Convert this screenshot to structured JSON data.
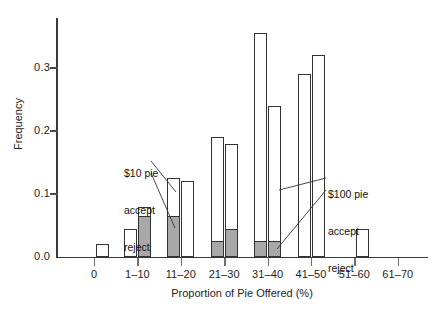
{
  "chart_data": {
    "type": "bar",
    "title": "",
    "subtitle": "",
    "xlabel": "Proportion of Pie Offered (%)",
    "ylabel": "Frequency",
    "categories": [
      "0",
      "1–10",
      "11–20",
      "21–30",
      "31–40",
      "41–50",
      "51–60",
      "61–70"
    ],
    "ylim": [
      0.0,
      0.39
    ],
    "xlim_note": "categorical, 8 bins",
    "grid": false,
    "legend_position": "inline-annotations",
    "ytick_labels": [
      "0.0",
      "0.1",
      "0.2",
      "0.3"
    ],
    "ytick_values": [
      0.0,
      0.1,
      0.2,
      0.3
    ],
    "series": [
      {
        "name": "$10 pie",
        "total_label": "accept",
        "sub_label": "reject",
        "description": "Total bar height = all offers; shaded (gray) lower portion = offers rejected",
        "total_values": [
          0.02,
          0.045,
          0.125,
          0.19,
          0.355,
          0.29,
          0.045,
          0.0
        ],
        "rejected_values": [
          0.0,
          0.0,
          0.0,
          0.025,
          0.025,
          0.0,
          0.0,
          0.0
        ]
      },
      {
        "name": "$100 pie",
        "total_label": "accept",
        "sub_label": "reject",
        "description": "Total bar height = all offers; shaded (gray) lower portion = offers rejected",
        "total_values": [
          0.0,
          0.08,
          0.12,
          0.18,
          0.24,
          0.32,
          0.0,
          0.0
        ],
        "rejected_values": [
          0.0,
          0.065,
          0.065,
          0.045,
          0.025,
          0.0,
          0.0,
          0.0
        ]
      }
    ],
    "bars": [
      {
        "category": "0",
        "series": "$10 pie",
        "total": 0.02,
        "rejected": 0.0
      },
      {
        "category": "1–10",
        "series": "$10 pie",
        "total": 0.045,
        "rejected": 0.0
      },
      {
        "category": "1–10",
        "series": "$100 pie",
        "total": 0.08,
        "rejected": 0.065
      },
      {
        "category": "11–20",
        "series": "$10 pie",
        "total": 0.125,
        "rejected": 0.065
      },
      {
        "category": "11–20",
        "series": "$100 pie",
        "total": 0.12,
        "rejected": 0.0
      },
      {
        "category": "21–30",
        "series": "$10 pie",
        "total": 0.19,
        "rejected": 0.025
      },
      {
        "category": "21–30",
        "series": "$100 pie",
        "total": 0.18,
        "rejected": 0.045
      },
      {
        "category": "31–40",
        "series": "$10 pie",
        "total": 0.355,
        "rejected": 0.025
      },
      {
        "category": "31–40",
        "series": "$100 pie",
        "total": 0.24,
        "rejected": 0.025
      },
      {
        "category": "41–50",
        "series": "$10 pie",
        "total": 0.29,
        "rejected": 0.0
      },
      {
        "category": "41–50",
        "series": "$100 pie",
        "total": 0.32,
        "rejected": 0.0
      },
      {
        "category": "51–60",
        "series": "$10 pie",
        "total": 0.045,
        "rejected": 0.0
      }
    ],
    "annotations": [
      {
        "id": "ten",
        "lines": [
          "$10 pie",
          "accept",
          "reject"
        ]
      },
      {
        "id": "hundred",
        "lines": [
          "$100 pie",
          "accept",
          "reject"
        ]
      }
    ],
    "colors": {
      "bar_outline": "#333333",
      "bar_fill_accept": "#ffffff",
      "bar_fill_reject": "#a8a8a8",
      "axis": "#3a3a3a",
      "text": "#111111",
      "background": "#ffffff"
    }
  },
  "axes": {
    "y_title": "Frequency",
    "x_title": "Proportion of Pie Offered (%)",
    "y_ticks": [
      {
        "label": "0.0",
        "value": 0.0
      },
      {
        "label": "0.1",
        "value": 0.1
      },
      {
        "label": "0.2",
        "value": 0.2
      },
      {
        "label": "0.3",
        "value": 0.3
      }
    ],
    "x_ticks": [
      {
        "label": "0"
      },
      {
        "label": "1–10"
      },
      {
        "label": "11–20"
      },
      {
        "label": "21–30"
      },
      {
        "label": "31–40"
      },
      {
        "label": "41–50"
      },
      {
        "label": "51–60"
      },
      {
        "label": "61–70"
      }
    ]
  },
  "annotations": {
    "ten_pie": {
      "title": "$10 pie",
      "accept": "accept",
      "reject": "reject"
    },
    "hundred_pie": {
      "title": "$100 pie",
      "accept": "accept",
      "reject": "reject"
    }
  }
}
